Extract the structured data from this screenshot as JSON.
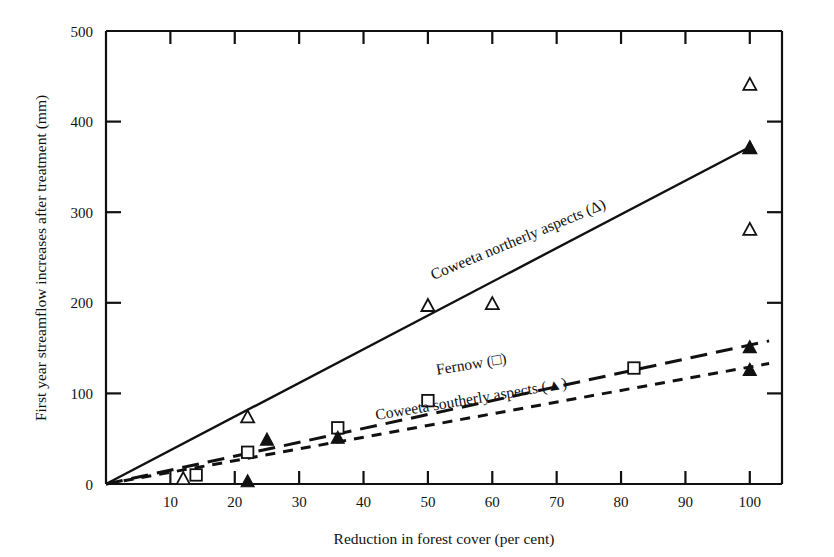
{
  "chart_data": {
    "type": "scatter",
    "title": "",
    "xlabel": "Reduction in forest cover (per cent)",
    "ylabel": "First year streamflow increases after treatment (mm)",
    "xlim": [
      0,
      105
    ],
    "ylim": [
      0,
      500
    ],
    "xticks": [
      0,
      10,
      20,
      30,
      40,
      50,
      60,
      70,
      80,
      90,
      100
    ],
    "xticklabels": [
      "",
      "10",
      "20",
      "30",
      "40",
      "50",
      "60",
      "70",
      "80",
      "90",
      "100"
    ],
    "yticks": [
      0,
      100,
      200,
      300,
      400,
      500
    ],
    "yticklabels": [
      "0",
      "100",
      "200",
      "300",
      "400",
      "500"
    ],
    "grid": false,
    "legend_position": "inline-along-lines",
    "series": [
      {
        "name": "Coweeta northerly aspects",
        "label": "Coweeta northerly aspects  (Δ)",
        "marker": "open-triangle",
        "line_style": "solid",
        "points": [
          {
            "x": 12,
            "y": 5
          },
          {
            "x": 22,
            "y": 73
          },
          {
            "x": 50,
            "y": 196
          },
          {
            "x": 60,
            "y": 198
          },
          {
            "x": 100,
            "y": 440
          },
          {
            "x": 100,
            "y": 370
          },
          {
            "x": 100,
            "y": 280
          }
        ],
        "fit_line": {
          "x0": 0,
          "y0": 0,
          "x1": 100,
          "y1": 372
        }
      },
      {
        "name": "Fernow",
        "label": "Fernow   (□)",
        "marker": "open-square",
        "line_style": "long-dash",
        "points": [
          {
            "x": 14,
            "y": 10
          },
          {
            "x": 22,
            "y": 35
          },
          {
            "x": 36,
            "y": 62
          },
          {
            "x": 50,
            "y": 92
          },
          {
            "x": 82,
            "y": 128
          }
        ],
        "fit_line": {
          "x0": 0,
          "y0": 0,
          "x1": 103,
          "y1": 158
        }
      },
      {
        "name": "Coweeta southerly aspects",
        "label": "Coweeta southerly aspects  (▲)",
        "marker": "filled-triangle",
        "line_style": "short-dash",
        "points": [
          {
            "x": 22,
            "y": 2
          },
          {
            "x": 25,
            "y": 48
          },
          {
            "x": 36,
            "y": 50
          },
          {
            "x": 100,
            "y": 150
          },
          {
            "x": 100,
            "y": 125
          },
          {
            "x": 100,
            "y": 370
          }
        ],
        "fit_line": {
          "x0": 0,
          "y0": 0,
          "x1": 103,
          "y1": 133
        }
      }
    ],
    "annotations": [
      {
        "id": "label-northerly",
        "text": "Coweeta northerly aspects  (Δ)",
        "rotation": -22.5,
        "x_px": 520,
        "y_px": 244
      },
      {
        "id": "label-fernow",
        "text": "Fernow   (□)",
        "rotation": -9.5,
        "x_px": 472,
        "y_px": 369
      },
      {
        "id": "label-southerly",
        "text": "Coweeta southerly aspects  (▲)",
        "rotation": -9.5,
        "x_px": 472,
        "y_px": 404
      }
    ],
    "colors": {
      "axis": "#111111",
      "line": "#111111",
      "marker_fill_open": "#ffffff",
      "marker_fill_solid": "#111111",
      "background": "#ffffff"
    }
  }
}
